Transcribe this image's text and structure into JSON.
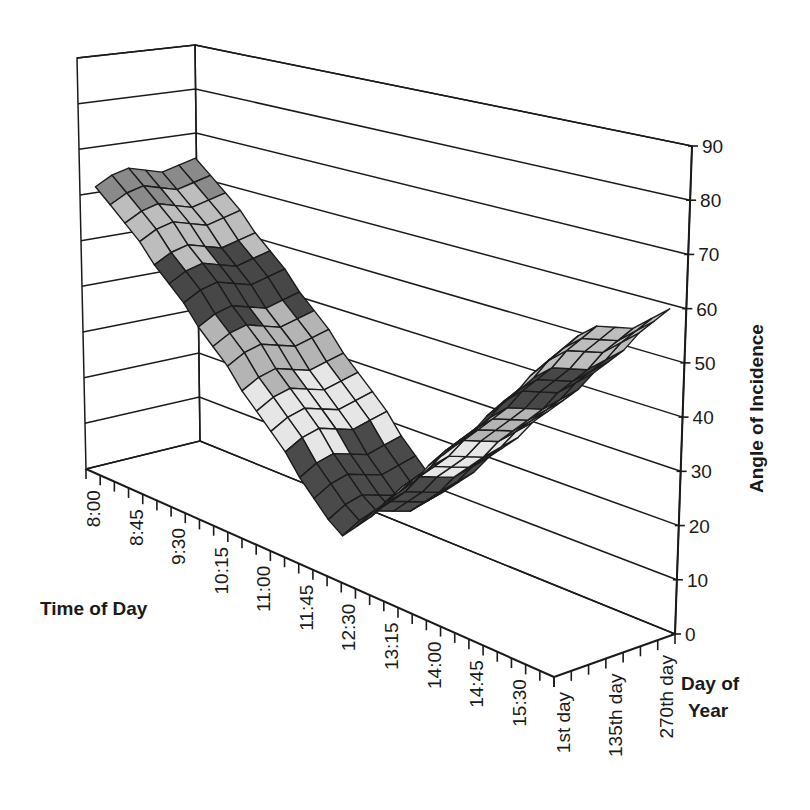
{
  "chart_data": {
    "type": "surface",
    "title": "",
    "xlabel": "Time of Day",
    "ylabel": "Day of Year",
    "zlabel": "Angle of Incidence",
    "zlim": [
      0,
      90
    ],
    "z_ticks": [
      0,
      10,
      20,
      30,
      40,
      50,
      60,
      70,
      80,
      90
    ],
    "grid": true,
    "legend": null,
    "x_categories": [
      "8:00",
      "8:15",
      "8:30",
      "8:45",
      "9:00",
      "9:15",
      "9:30",
      "9:45",
      "10:00",
      "10:15",
      "10:30",
      "10:45",
      "11:00",
      "11:15",
      "11:30",
      "11:45",
      "12:00",
      "12:15",
      "12:30",
      "12:45",
      "13:00",
      "13:15",
      "13:30",
      "13:45",
      "14:00",
      "14:15",
      "14:30",
      "14:45",
      "15:00",
      "15:15",
      "15:30",
      "15:45",
      "16:00"
    ],
    "x_tick_labels": [
      "8:00",
      "8:45",
      "9:30",
      "10:15",
      "11:00",
      "11:45",
      "12:30",
      "13:15",
      "14:00",
      "14:45",
      "15:30"
    ],
    "y_categories": [
      "1st day",
      "45th day",
      "90th day",
      "135th day",
      "180th day",
      "225th day",
      "270th day"
    ],
    "y_tick_labels": [
      "1st day",
      "135th day",
      "270th day"
    ],
    "band_colors": [
      "#8c8c8c",
      "#4a4a4a",
      "#e6e6e6",
      "#b4b4b4",
      "#474747",
      "#bdbdbd",
      "#8a8a8a",
      "#b0b0b0",
      "#4a4a4a"
    ],
    "series": [
      {
        "name": "1st day",
        "values": [
          62,
          59,
          56,
          53,
          49,
          46,
          43,
          39,
          36,
          33,
          29,
          26,
          23,
          20,
          16,
          13,
          10,
          8,
          11,
          14,
          18,
          21,
          24,
          28,
          31,
          34,
          37,
          41,
          44,
          47,
          51,
          54,
          57
        ]
      },
      {
        "name": "45th day",
        "values": [
          64,
          61,
          58,
          55,
          51,
          48,
          45,
          41,
          38,
          35,
          31,
          28,
          25,
          22,
          18,
          15,
          12,
          10,
          13,
          16,
          20,
          23,
          26,
          30,
          33,
          36,
          39,
          43,
          46,
          49,
          53,
          56,
          59
        ]
      },
      {
        "name": "90th day",
        "values": [
          65,
          62,
          59,
          56,
          52,
          49,
          46,
          42,
          39,
          36,
          32,
          29,
          26,
          23,
          19,
          16,
          13,
          11,
          14,
          17,
          21,
          24,
          27,
          31,
          34,
          37,
          40,
          44,
          47,
          50,
          54,
          57,
          60
        ]
      },
      {
        "name": "135th day",
        "values": [
          64,
          61,
          58,
          55,
          51,
          48,
          45,
          41,
          38,
          35,
          31,
          28,
          25,
          22,
          18,
          15,
          12,
          10,
          13,
          16,
          20,
          23,
          26,
          30,
          33,
          36,
          39,
          43,
          46,
          49,
          53,
          56,
          59
        ]
      },
      {
        "name": "180th day",
        "values": [
          63,
          60,
          57,
          54,
          50,
          47,
          44,
          40,
          37,
          34,
          30,
          27,
          24,
          21,
          17,
          14,
          11,
          9,
          12,
          15,
          19,
          22,
          25,
          29,
          32,
          35,
          38,
          42,
          45,
          48,
          52,
          55,
          58
        ]
      },
      {
        "name": "225th day",
        "values": [
          64,
          61,
          58,
          55,
          51,
          48,
          45,
          41,
          38,
          35,
          31,
          28,
          25,
          22,
          18,
          15,
          12,
          10,
          13,
          16,
          20,
          23,
          26,
          30,
          33,
          36,
          39,
          43,
          46,
          49,
          53,
          56,
          59
        ]
      },
      {
        "name": "270th day",
        "values": [
          65,
          62,
          59,
          56,
          52,
          49,
          46,
          42,
          39,
          36,
          32,
          29,
          26,
          23,
          19,
          16,
          13,
          11,
          14,
          17,
          21,
          24,
          27,
          31,
          34,
          37,
          40,
          44,
          47,
          50,
          54,
          57,
          60
        ]
      }
    ]
  },
  "axes": {
    "time_title": "Time of Day",
    "day_title_line1": "Day of",
    "day_title_line2": "Year",
    "value_title": "Angle of Incidence"
  }
}
